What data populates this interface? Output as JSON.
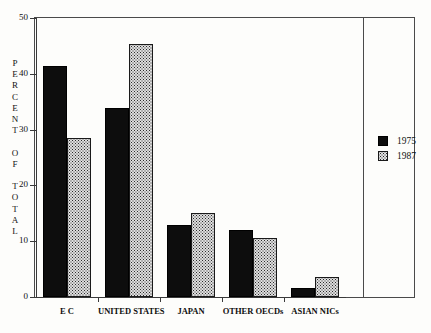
{
  "chart_data": {
    "type": "bar",
    "title": "",
    "subtitle": "",
    "xlabel": "",
    "ylabel": "PERCENT OF TOTAL",
    "ylim": [
      0,
      50
    ],
    "yticks": [
      0,
      10,
      20,
      30,
      40,
      50
    ],
    "ytick_labels": [
      "0",
      "10",
      "20",
      "30",
      "40",
      "50"
    ],
    "grid": false,
    "legend_position": "right",
    "categories": [
      "E C",
      "UNITED STATES",
      "JAPAN",
      "OTHER OECDs",
      "ASIAN NICs"
    ],
    "series": [
      {
        "name": "1975",
        "fill": "solid-black",
        "color": "#0d0d0d",
        "values": [
          41.4,
          33.9,
          12.9,
          12.0,
          1.7
        ]
      },
      {
        "name": "1987",
        "fill": "dotted-hatch",
        "color": "#dedede",
        "values": [
          28.5,
          45.3,
          15.1,
          10.6,
          3.5
        ]
      }
    ]
  },
  "axis": {
    "y_title_stacked": "P\nE\nR\nC\nE\nN\nT\n \nO\nF\n \nT\nO\nT\nA\nL"
  },
  "legend": {
    "entries": [
      {
        "label": "1975"
      },
      {
        "label": "1987"
      }
    ]
  },
  "colors": {
    "frame": "#4a4a4a",
    "axis": "#3a3a3a",
    "background": "#fdfdfb",
    "series_1975": "#0d0d0d",
    "series_1987": "#dedede",
    "text": "#111111"
  }
}
